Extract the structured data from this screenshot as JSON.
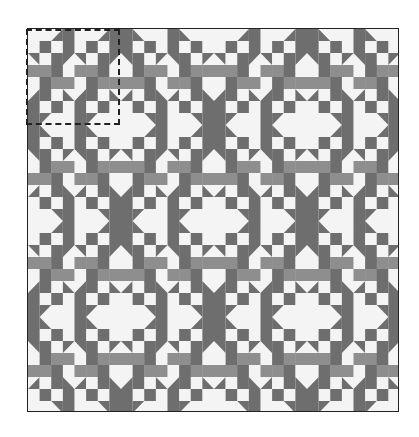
{
  "figure": {
    "type": "quilt-pattern-illustration",
    "grid": {
      "blocks_x": 4,
      "blocks_y": 4,
      "cells_per_block": 8
    },
    "colors": {
      "dark": "#6e6e6e",
      "medium": "#8e8e8e",
      "light": "#f4f4f4",
      "border": "#222222"
    },
    "block": [
      [
        "W",
        "W",
        "TDR",
        "D",
        "W",
        "W",
        "TDR",
        "D"
      ],
      [
        "W",
        "D",
        "W",
        "D",
        "W",
        "D",
        "W",
        "D"
      ],
      [
        "TUR",
        "W",
        "D",
        "TUL",
        "TUR",
        "W",
        "D",
        "TUL"
      ],
      [
        "M",
        "M",
        "D",
        "W",
        "M",
        "M",
        "D",
        "W"
      ],
      [
        "W",
        "D",
        "M",
        "M",
        "W",
        "D",
        "M",
        "M"
      ],
      [
        "TDR",
        "D",
        "W",
        "TDL",
        "TDR",
        "D",
        "W",
        "TDL"
      ],
      [
        "D",
        "W",
        "D",
        "W",
        "D",
        "W",
        "D",
        "W"
      ],
      [
        "D",
        "TUL",
        "W",
        "W",
        "D",
        "TUL",
        "W",
        "W"
      ]
    ],
    "highlighted_block": {
      "row": 0,
      "col": 0,
      "style": "dashed"
    }
  }
}
